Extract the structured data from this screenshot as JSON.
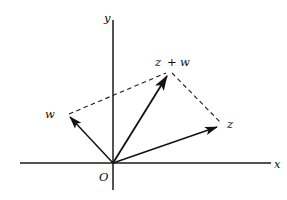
{
  "figure": {
    "background_color": "#ffffff",
    "ink_color": "#121212",
    "axes": {
      "x_axis_label": "x",
      "y_axis_label": "y",
      "origin_label": "O"
    },
    "vectors": [
      {
        "id": "vector-w",
        "label": "w",
        "style": "solid",
        "from": "origin",
        "to": "w-tip"
      },
      {
        "id": "vector-z",
        "label": "z",
        "style": "solid",
        "from": "origin",
        "to": "z-tip"
      },
      {
        "id": "vector-z-plus-w",
        "label_parts": {
          "left": "z",
          "operator": "+",
          "right": "w"
        },
        "label": "z + w",
        "style": "solid",
        "from": "origin",
        "to": "sum-tip"
      }
    ],
    "construction_lines": [
      {
        "id": "dashed-w-to-sum",
        "style": "dashed",
        "from": "w-tip",
        "to": "sum-tip"
      },
      {
        "id": "dashed-sum-to-z",
        "style": "dashed",
        "from": "sum-tip",
        "to": "z-tip"
      }
    ],
    "geometry": {
      "origin": {
        "x": 113,
        "y": 163
      },
      "x_axis_start": {
        "x": 20,
        "y": 163
      },
      "x_axis_end": {
        "x": 271,
        "y": 163
      },
      "y_axis_top": {
        "x": 113,
        "y": 20
      },
      "y_axis_bottom": {
        "x": 113,
        "y": 190
      },
      "w_tip": {
        "x": 67,
        "y": 114
      },
      "z_tip": {
        "x": 222,
        "y": 125
      },
      "sum_tip": {
        "x": 169,
        "y": 71
      }
    },
    "label_positions": {
      "y": {
        "x": 106,
        "y": 20
      },
      "x": {
        "x": 275,
        "y": 167
      },
      "origin": {
        "x": 100,
        "y": 179
      },
      "w": {
        "x": 46,
        "y": 115
      },
      "z": {
        "x": 228,
        "y": 125
      },
      "sum": {
        "x": 155,
        "y": 65
      }
    }
  }
}
